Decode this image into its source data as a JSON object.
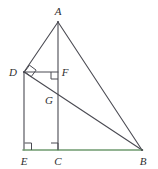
{
  "figure": {
    "canvas": {
      "width": 158,
      "height": 169,
      "background": "#ffffff"
    },
    "colors": {
      "stroke": "#4a4a52",
      "baseline_green": "#6f9a6f",
      "label_text": "#2f2f2f"
    },
    "stroke_width": 1.1
  },
  "points": [
    {
      "id": "A",
      "label": "A",
      "x": 58,
      "y": 22,
      "label_x": 58,
      "label_y": 11
    },
    {
      "id": "D",
      "label": "D",
      "x": 24,
      "y": 72,
      "label_x": 13,
      "label_y": 72
    },
    {
      "id": "F",
      "label": "F",
      "x": 58,
      "y": 72,
      "label_x": 65,
      "label_y": 72
    },
    {
      "id": "G",
      "label": "G",
      "x": 58,
      "y": 101,
      "label_x": 49,
      "label_y": 100
    },
    {
      "id": "E",
      "label": "E",
      "x": 24,
      "y": 150,
      "label_x": 24,
      "label_y": 161
    },
    {
      "id": "C",
      "label": "C",
      "x": 58,
      "y": 150,
      "label_x": 58,
      "label_y": 161
    },
    {
      "id": "B",
      "label": "B",
      "x": 142,
      "y": 150,
      "label_x": 143,
      "label_y": 161
    }
  ],
  "segments": [
    {
      "id": "AD",
      "from": "A",
      "to": "D",
      "x1": 58,
      "y1": 22,
      "x2": 24,
      "y2": 72,
      "color": "#4a4a52"
    },
    {
      "id": "AB",
      "from": "A",
      "to": "B",
      "x1": 58,
      "y1": 22,
      "x2": 142,
      "y2": 150,
      "color": "#4a4a52"
    },
    {
      "id": "AC",
      "from": "A",
      "to": "C",
      "x1": 58,
      "y1": 22,
      "x2": 58,
      "y2": 150,
      "color": "#4a4a52"
    },
    {
      "id": "DF",
      "from": "D",
      "to": "F",
      "x1": 24,
      "y1": 72,
      "x2": 58,
      "y2": 72,
      "color": "#4a4a52"
    },
    {
      "id": "DB",
      "from": "D",
      "to": "B",
      "x1": 24,
      "y1": 72,
      "x2": 142,
      "y2": 150,
      "color": "#4a4a52"
    },
    {
      "id": "DE",
      "from": "D",
      "to": "E",
      "x1": 24,
      "y1": 72,
      "x2": 24,
      "y2": 150,
      "color": "#4a4a52"
    },
    {
      "id": "EB",
      "from": "E",
      "to": "B",
      "x1": 24,
      "y1": 150,
      "x2": 142,
      "y2": 150,
      "color": "#6f9a6f"
    }
  ],
  "right_angle_marks": [
    {
      "id": "angle-at-D",
      "at": "D",
      "path": "M 29.5 65.2 L 36.1 70.1 L 31.2 76.7 L 24.6 71.8 Z"
    },
    {
      "id": "angle-at-F",
      "at": "F",
      "path": "M 51 72 L 51 79 L 58 79 L 58 72"
    },
    {
      "id": "angle-at-E",
      "at": "E",
      "path": "M 24 143 L 31 143 L 31 150"
    },
    {
      "id": "angle-at-C",
      "at": "C",
      "path": "M 51 143 L 58 143 L 58 150"
    }
  ]
}
